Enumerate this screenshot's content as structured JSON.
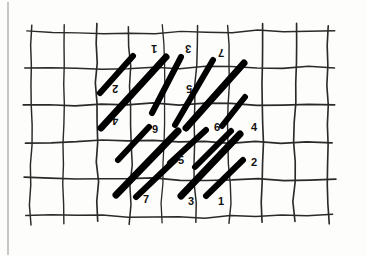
{
  "figure": {
    "page_border_color": "#b9b9b9",
    "grid_color": "#2a2a2a",
    "stroke_color": "#000000",
    "background_color": "#fdfdfc",
    "grid": {
      "columns": 10,
      "rows": 6,
      "x_lines": [
        31,
        64,
        97,
        130,
        163,
        196,
        229,
        262,
        295,
        328
      ],
      "y_lines": [
        32,
        68,
        105,
        142,
        179,
        216
      ],
      "cell_width": 33,
      "cell_height": 37
    },
    "strokes": [
      {
        "id": "s-a1",
        "x1": 100,
        "y1": 93,
        "x2": 133,
        "y2": 56,
        "width": 6
      },
      {
        "id": "s-a2",
        "x1": 101,
        "y1": 128,
        "x2": 166,
        "y2": 57,
        "width": 7
      },
      {
        "id": "s-a3",
        "x1": 152,
        "y1": 113,
        "x2": 181,
        "y2": 57,
        "width": 6
      },
      {
        "id": "s-a4",
        "x1": 175,
        "y1": 125,
        "x2": 213,
        "y2": 60,
        "width": 6
      },
      {
        "id": "s-a5",
        "x1": 186,
        "y1": 128,
        "x2": 244,
        "y2": 63,
        "width": 7
      },
      {
        "id": "s-a6",
        "x1": 222,
        "y1": 126,
        "x2": 245,
        "y2": 97,
        "width": 6
      },
      {
        "id": "s-b1",
        "x1": 118,
        "y1": 160,
        "x2": 149,
        "y2": 127,
        "width": 6
      },
      {
        "id": "s-b2",
        "x1": 116,
        "y1": 195,
        "x2": 178,
        "y2": 131,
        "width": 7
      },
      {
        "id": "s-b3",
        "x1": 170,
        "y1": 163,
        "x2": 206,
        "y2": 130,
        "width": 6
      },
      {
        "id": "s-b4",
        "x1": 195,
        "y1": 167,
        "x2": 231,
        "y2": 131,
        "width": 6
      },
      {
        "id": "s-b5",
        "x1": 181,
        "y1": 196,
        "x2": 240,
        "y2": 134,
        "width": 7
      },
      {
        "id": "s-b6",
        "x1": 136,
        "y1": 197,
        "x2": 176,
        "y2": 159,
        "width": 6
      },
      {
        "id": "s-c1",
        "x1": 206,
        "y1": 196,
        "x2": 243,
        "y2": 160,
        "width": 6
      }
    ],
    "labels": [
      {
        "id": "lbl-top-1",
        "text": "1",
        "x": 151,
        "y": 43,
        "rotated": true
      },
      {
        "id": "lbl-top-3",
        "text": "3",
        "x": 185,
        "y": 43,
        "rotated": true
      },
      {
        "id": "lbl-top-7",
        "text": "7",
        "x": 218,
        "y": 47,
        "rotated": true
      },
      {
        "id": "lbl-left-2",
        "text": "2",
        "x": 112,
        "y": 83,
        "rotated": true
      },
      {
        "id": "lbl-mid-5",
        "text": "5",
        "x": 186,
        "y": 83,
        "rotated": true
      },
      {
        "id": "lbl-left-4",
        "text": "4",
        "x": 112,
        "y": 115,
        "rotated": true
      },
      {
        "id": "lbl-9",
        "text": "9",
        "x": 152,
        "y": 124,
        "rotated": false
      },
      {
        "id": "lbl-6",
        "text": "6",
        "x": 214,
        "y": 122,
        "rotated": false
      },
      {
        "id": "lbl-4",
        "text": "4",
        "x": 251,
        "y": 122,
        "rotated": false
      },
      {
        "id": "lbl-5",
        "text": "5",
        "x": 178,
        "y": 155,
        "rotated": false
      },
      {
        "id": "lbl-2",
        "text": "2",
        "x": 251,
        "y": 157,
        "rotated": false
      },
      {
        "id": "lbl-bot-7",
        "text": "7",
        "x": 143,
        "y": 194,
        "rotated": false
      },
      {
        "id": "lbl-bot-3",
        "text": "3",
        "x": 188,
        "y": 196,
        "rotated": false
      },
      {
        "id": "lbl-bot-1",
        "text": "1",
        "x": 218,
        "y": 196,
        "rotated": false
      }
    ]
  }
}
